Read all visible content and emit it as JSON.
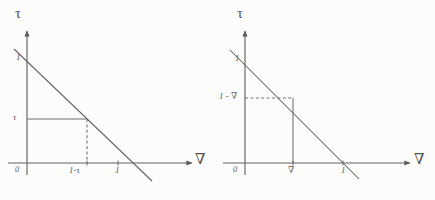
{
  "figure": {
    "type": "diagram",
    "background_color": "#fdfdfc",
    "ink_color": "#2e2c2b"
  },
  "panels": [
    {
      "id": "left",
      "axes": {
        "y_axis_label": "τ",
        "x_axis_label": "∇",
        "origin_label": "0"
      },
      "y_ticks": [
        {
          "label": "1",
          "value": 1.0
        },
        {
          "label": "τ",
          "value": 0.42
        }
      ],
      "x_ticks": [
        {
          "label": "1-τ",
          "value": 0.58
        },
        {
          "label": "1",
          "value": 1.0
        }
      ],
      "line": {
        "equation": "τ + ∇ = 1",
        "y_intercept": 1.0,
        "x_intercept": 1.0,
        "slope": -1
      },
      "construction": {
        "horizontal_style": "solid",
        "vertical_style": "dashed",
        "point_x": 0.58,
        "point_y": 0.42
      }
    },
    {
      "id": "right",
      "axes": {
        "y_axis_label": "τ",
        "x_axis_label": "∇",
        "origin_label": "0"
      },
      "y_ticks": [
        {
          "label": "1",
          "value": 1.0
        },
        {
          "label": "1 - ∇",
          "value": 0.66
        }
      ],
      "x_ticks": [
        {
          "label": "∇",
          "value": 0.34
        },
        {
          "label": "1",
          "value": 1.0
        }
      ],
      "line": {
        "equation": "τ + ∇ = 1",
        "y_intercept": 1.0,
        "x_intercept": 1.0,
        "slope": -1
      },
      "construction": {
        "horizontal_style": "dashed",
        "vertical_style": "solid",
        "point_x": 0.34,
        "point_y": 0.66
      }
    }
  ]
}
